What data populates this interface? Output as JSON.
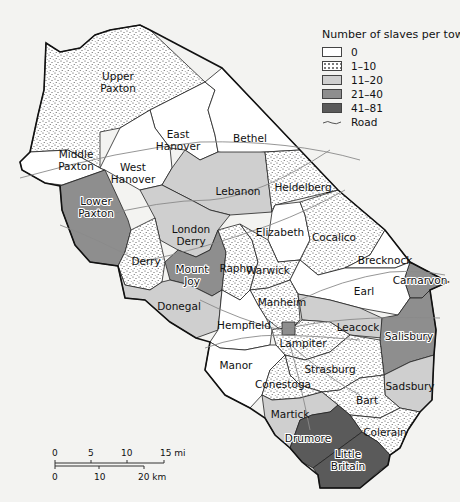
{
  "legend": {
    "title": "Number of slaves per town",
    "classes": [
      {
        "label": "0",
        "color": "#ffffff",
        "pattern": "none"
      },
      {
        "label": "1–10",
        "color": "#ffffff",
        "pattern": "stipple"
      },
      {
        "label": "11–20",
        "color": "#cfcfcf",
        "pattern": "none"
      },
      {
        "label": "21–40",
        "color": "#8e8e8e",
        "pattern": "none"
      },
      {
        "label": "41–81",
        "color": "#5a5a5a",
        "pattern": "none"
      }
    ],
    "road_label": "Road"
  },
  "towns": [
    {
      "name": "Upper Paxton",
      "lines": [
        "Upper",
        "Paxton"
      ],
      "class": "1–10"
    },
    {
      "name": "Middle Paxton",
      "lines": [
        "Middle",
        "Paxton"
      ],
      "class": "0"
    },
    {
      "name": "East Hanover",
      "lines": [
        "East",
        "Hanover"
      ],
      "class": "0"
    },
    {
      "name": "Bethel",
      "lines": [
        "Bethel"
      ],
      "class": "0"
    },
    {
      "name": "West Hanover",
      "lines": [
        "West",
        "Hanover"
      ],
      "class": "0"
    },
    {
      "name": "Lebanon",
      "lines": [
        "Lebanon"
      ],
      "class": "11–20"
    },
    {
      "name": "Heidelberg",
      "lines": [
        "Heidelberg"
      ],
      "class": "1–10"
    },
    {
      "name": "Lower Paxton",
      "lines": [
        "Lower",
        "Paxton"
      ],
      "class": "21–40"
    },
    {
      "name": "London Derry",
      "lines": [
        "London",
        "Derry"
      ],
      "class": "11–20"
    },
    {
      "name": "Elizabeth",
      "lines": [
        "Elizabeth"
      ],
      "class": "0"
    },
    {
      "name": "Cocalico",
      "lines": [
        "Cocalico"
      ],
      "class": "1–10"
    },
    {
      "name": "Brecknock",
      "lines": [
        "Brecknock"
      ],
      "class": "0"
    },
    {
      "name": "Derry",
      "lines": [
        "Derry"
      ],
      "class": "1–10"
    },
    {
      "name": "Mount Joy",
      "lines": [
        "Mount",
        "Joy"
      ],
      "class": "21–40"
    },
    {
      "name": "Rapho",
      "lines": [
        "Rapho"
      ],
      "class": "1–10"
    },
    {
      "name": "Warwick",
      "lines": [
        "Warwick"
      ],
      "class": "1–10"
    },
    {
      "name": "Carnarvon",
      "lines": [
        "Carnarvon"
      ],
      "class": "21–40"
    },
    {
      "name": "Earl",
      "lines": [
        "Earl"
      ],
      "class": "0"
    },
    {
      "name": "Donegal",
      "lines": [
        "Donegal"
      ],
      "class": "11–20"
    },
    {
      "name": "Manheim",
      "lines": [
        "Manheim"
      ],
      "class": "1–10"
    },
    {
      "name": "Leacock",
      "lines": [
        "Leacock"
      ],
      "class": "11–20"
    },
    {
      "name": "Hempfield",
      "lines": [
        "Hempfield"
      ],
      "class": "0"
    },
    {
      "name": "Lampiter",
      "lines": [
        "Lampiter"
      ],
      "class": "1–10"
    },
    {
      "name": "Salisbury",
      "lines": [
        "Salisbury"
      ],
      "class": "21–40"
    },
    {
      "name": "Manor",
      "lines": [
        "Manor"
      ],
      "class": "0"
    },
    {
      "name": "Strasburg",
      "lines": [
        "Strasburg"
      ],
      "class": "1–10"
    },
    {
      "name": "Conestoga",
      "lines": [
        "Conestoga"
      ],
      "class": "1–10"
    },
    {
      "name": "Sadsbury",
      "lines": [
        "Sadsbury"
      ],
      "class": "11–20"
    },
    {
      "name": "Bart",
      "lines": [
        "Bart"
      ],
      "class": "1–10"
    },
    {
      "name": "Martick",
      "lines": [
        "Martick"
      ],
      "class": "11–20"
    },
    {
      "name": "Colerain",
      "lines": [
        "Colerain"
      ],
      "class": "1–10"
    },
    {
      "name": "Drumore",
      "lines": [
        "Drumore"
      ],
      "class": "41–81"
    },
    {
      "name": "Little Britain",
      "lines": [
        "Little",
        "Britain"
      ],
      "class": "41–81"
    },
    {
      "name": "Lancaster",
      "lines": [],
      "class": "21–40"
    }
  ],
  "scale": {
    "miles": [
      "0",
      "5",
      "10",
      "15 mi"
    ],
    "km": [
      "0",
      "10",
      "20 km"
    ]
  }
}
